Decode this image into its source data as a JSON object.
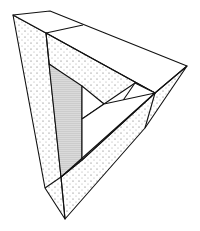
{
  "figure": {
    "subject": "Penrose triangle (impossible triangle) stippled line drawing",
    "colors": {
      "background": "#ffffff",
      "stroke": "#111111",
      "stipple": "#333333"
    }
  }
}
